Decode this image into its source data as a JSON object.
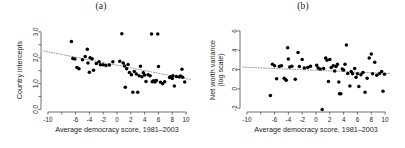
{
  "figure": {
    "background_color": "#ffffff",
    "point_color": "#000000",
    "axis_color": "#4d4d4d",
    "trend_color": "#8c8c8c"
  },
  "chart_data": [
    {
      "type": "scatter",
      "title": "(a)",
      "xlabel": "Average democracy score, 1981–2003",
      "ylabel": "Country intercepts",
      "xlim": [
        -11,
        11
      ],
      "ylim": [
        -0.1,
        3.15
      ],
      "grid": false,
      "legend": null,
      "xticks": [
        -10,
        -8,
        -6,
        -4,
        -2,
        0,
        2,
        4,
        6,
        8,
        10
      ],
      "xticklabels": [
        "-10",
        "",
        "-6",
        "-4",
        "-2",
        "0",
        "2",
        "4",
        "6",
        "8",
        "10"
      ],
      "yticks": [
        0.0,
        0.5,
        1.0,
        1.5,
        2.0,
        2.5,
        3.0
      ],
      "yticklabels": [
        "0.0",
        "",
        "1.0",
        "",
        "2.0",
        "",
        "3.0"
      ],
      "trendline": {
        "style": "dotted",
        "x": [
          -10.6,
          10.6
        ],
        "y": [
          2.26,
          1.16
        ]
      },
      "points": [
        [
          -6.6,
          2.63
        ],
        [
          -6.4,
          1.97
        ],
        [
          -6.1,
          1.95
        ],
        [
          -5.8,
          1.62
        ],
        [
          -5.5,
          1.57
        ],
        [
          -5.0,
          1.92
        ],
        [
          -4.6,
          2.05
        ],
        [
          -4.3,
          2.33
        ],
        [
          -4.2,
          1.8
        ],
        [
          -4.0,
          1.44
        ],
        [
          -3.9,
          2.0
        ],
        [
          -3.6,
          1.96
        ],
        [
          -3.4,
          1.52
        ],
        [
          -3.0,
          1.78
        ],
        [
          -2.6,
          1.84
        ],
        [
          -2.4,
          1.73
        ],
        [
          -2.0,
          1.73
        ],
        [
          -1.6,
          1.7
        ],
        [
          -1.1,
          1.72
        ],
        [
          -0.6,
          1.84
        ],
        [
          0.4,
          1.86
        ],
        [
          0.7,
          2.93
        ],
        [
          0.9,
          1.8
        ],
        [
          1.1,
          1.68
        ],
        [
          1.2,
          0.86
        ],
        [
          1.4,
          1.57
        ],
        [
          1.6,
          1.74
        ],
        [
          1.8,
          1.43
        ],
        [
          2.1,
          1.34
        ],
        [
          2.3,
          0.66
        ],
        [
          2.5,
          1.47
        ],
        [
          2.8,
          1.37
        ],
        [
          3.0,
          0.66
        ],
        [
          3.2,
          1.3
        ],
        [
          3.4,
          1.67
        ],
        [
          3.6,
          1.26
        ],
        [
          3.8,
          1.42
        ],
        [
          4.0,
          1.33
        ],
        [
          4.2,
          1.08
        ],
        [
          4.5,
          1.34
        ],
        [
          4.8,
          1.3
        ],
        [
          5.0,
          2.92
        ],
        [
          5.1,
          1.07
        ],
        [
          5.3,
          1.11
        ],
        [
          5.5,
          1.06
        ],
        [
          5.7,
          1.12
        ],
        [
          5.9,
          2.92
        ],
        [
          6.0,
          1.66
        ],
        [
          6.3,
          1.05
        ],
        [
          6.6,
          0.99
        ],
        [
          7.6,
          1.23
        ],
        [
          7.8,
          1.26
        ],
        [
          8.0,
          1.2
        ],
        [
          8.1,
          1.3
        ],
        [
          8.3,
          0.91
        ],
        [
          8.6,
          1.27
        ],
        [
          9.0,
          1.25
        ],
        [
          9.2,
          1.29
        ],
        [
          9.4,
          1.55
        ],
        [
          9.5,
          1.24
        ],
        [
          9.8,
          1.06
        ],
        [
          6.9,
          1.07
        ]
      ]
    },
    {
      "type": "scatter",
      "title": "(b)",
      "xlabel": "Average democracy score, 1981–2003",
      "ylabel": "Net worth variance",
      "ylabel_sub": "(log scale)",
      "xlim": [
        -11,
        11
      ],
      "ylim": [
        -2.4,
        6.3
      ],
      "grid": false,
      "legend": null,
      "xticks": [
        -10,
        -8,
        -6,
        -4,
        -2,
        0,
        2,
        4,
        6,
        8,
        10
      ],
      "xticklabels": [
        "-10",
        "",
        "-6",
        "-4",
        "-2",
        "0",
        "2",
        "4",
        "6",
        "8",
        "10"
      ],
      "yticks": [
        -2,
        0,
        2,
        4,
        6
      ],
      "yticklabels": [
        "-2",
        "0",
        "2",
        "4",
        "6"
      ],
      "trendline": {
        "style": "dotted",
        "x": [
          -10.6,
          10.6
        ],
        "y": [
          2.25,
          1.58
        ]
      },
      "points": [
        [
          -6.6,
          -0.7
        ],
        [
          -6.3,
          2.55
        ],
        [
          -6.0,
          2.4
        ],
        [
          -5.7,
          1.05
        ],
        [
          -5.3,
          2.35
        ],
        [
          -5.0,
          2.4
        ],
        [
          -4.6,
          1.1
        ],
        [
          -4.4,
          0.95
        ],
        [
          -4.3,
          0.9
        ],
        [
          -4.1,
          4.25
        ],
        [
          -4.0,
          3.1
        ],
        [
          -3.8,
          2.25
        ],
        [
          -3.5,
          2.35
        ],
        [
          -3.0,
          1.0
        ],
        [
          -2.6,
          3.75
        ],
        [
          -2.4,
          2.3
        ],
        [
          -2.0,
          3.05
        ],
        [
          -1.7,
          2.15
        ],
        [
          -1.2,
          2.2
        ],
        [
          -0.8,
          2.35
        ],
        [
          0.3,
          2.15
        ],
        [
          0.6,
          2.05
        ],
        [
          0.9,
          -2.15
        ],
        [
          1.1,
          2.1
        ],
        [
          1.4,
          3.2
        ],
        [
          1.6,
          2.95
        ],
        [
          1.8,
          0.75
        ],
        [
          2.0,
          3.05
        ],
        [
          2.2,
          2.2
        ],
        [
          2.5,
          2.4
        ],
        [
          2.7,
          1.85
        ],
        [
          2.9,
          2.3
        ],
        [
          3.1,
          2.55
        ],
        [
          3.3,
          0.7
        ],
        [
          3.4,
          -0.5
        ],
        [
          3.6,
          -0.5
        ],
        [
          3.8,
          2.05
        ],
        [
          4.0,
          1.95
        ],
        [
          4.2,
          2.55
        ],
        [
          4.4,
          4.55
        ],
        [
          4.6,
          1.6
        ],
        [
          4.9,
          0.3
        ],
        [
          5.1,
          1.8
        ],
        [
          5.3,
          1.55
        ],
        [
          5.6,
          2.1
        ],
        [
          5.8,
          1.2
        ],
        [
          6.0,
          1.55
        ],
        [
          6.2,
          0.25
        ],
        [
          6.5,
          1.45
        ],
        [
          6.8,
          1.7
        ],
        [
          7.1,
          -0.35
        ],
        [
          7.4,
          1.1
        ],
        [
          7.7,
          3.2
        ],
        [
          8.0,
          3.6
        ],
        [
          8.2,
          1.55
        ],
        [
          8.5,
          2.75
        ],
        [
          8.8,
          1.4
        ],
        [
          9.2,
          1.6
        ],
        [
          9.5,
          1.8
        ],
        [
          9.7,
          -0.25
        ],
        [
          9.9,
          1.5
        ],
        [
          0.1,
          2.45
        ]
      ]
    }
  ]
}
